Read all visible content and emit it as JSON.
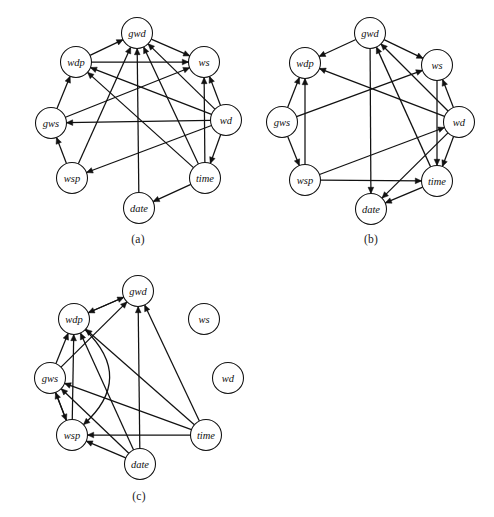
{
  "figure": {
    "width": 494,
    "height": 517,
    "background": "#ffffff",
    "ink_color": "#111111",
    "node_radius": 15.5,
    "arrow_size": 6.2
  },
  "panels": [
    {
      "id": "a",
      "caption": "(a)",
      "caption_x": 138,
      "caption_y": 233,
      "origin_x": 0,
      "origin_y": 0,
      "width": 247,
      "height": 225,
      "nodes": [
        {
          "name": "gwd",
          "label": "gwd",
          "x": 137,
          "y": 33
        },
        {
          "name": "wdp",
          "label": "wdp",
          "x": 76,
          "y": 62
        },
        {
          "name": "ws",
          "label": "ws",
          "x": 204,
          "y": 62
        },
        {
          "name": "gws",
          "label": "gws",
          "x": 51,
          "y": 123
        },
        {
          "name": "wd",
          "label": "wd",
          "x": 226,
          "y": 120
        },
        {
          "name": "wsp",
          "label": "wsp",
          "x": 72,
          "y": 178
        },
        {
          "name": "time",
          "label": "time",
          "x": 205,
          "y": 178
        },
        {
          "name": "date",
          "label": "date",
          "x": 139,
          "y": 208
        }
      ],
      "edges": [
        {
          "from": "wdp",
          "to": "gwd"
        },
        {
          "from": "gwd",
          "to": "ws"
        },
        {
          "from": "wdp",
          "to": "ws"
        },
        {
          "from": "gws",
          "to": "wdp"
        },
        {
          "from": "wsp",
          "to": "gws"
        },
        {
          "from": "wd",
          "to": "ws"
        },
        {
          "from": "wd",
          "to": "gwd"
        },
        {
          "from": "wd",
          "to": "wdp"
        },
        {
          "from": "wd",
          "to": "gws"
        },
        {
          "from": "wd",
          "to": "wsp"
        },
        {
          "from": "wd",
          "to": "time"
        },
        {
          "from": "time",
          "to": "gwd"
        },
        {
          "from": "time",
          "to": "ws"
        },
        {
          "from": "time",
          "to": "wdp"
        },
        {
          "from": "time",
          "to": "date"
        },
        {
          "from": "date",
          "to": "gwd"
        },
        {
          "from": "wsp",
          "to": "gwd"
        },
        {
          "from": "gws",
          "to": "ws"
        }
      ]
    },
    {
      "id": "b",
      "caption": "(b)",
      "caption_x": 371,
      "caption_y": 233,
      "origin_x": 247,
      "origin_y": 0,
      "width": 247,
      "height": 225,
      "nodes": [
        {
          "name": "gwd",
          "label": "gwd",
          "x": 370,
          "y": 33
        },
        {
          "name": "wdp",
          "label": "wdp",
          "x": 305,
          "y": 63
        },
        {
          "name": "ws",
          "label": "ws",
          "x": 437,
          "y": 65
        },
        {
          "name": "gws",
          "label": "gws",
          "x": 282,
          "y": 122
        },
        {
          "name": "wd",
          "label": "wd",
          "x": 459,
          "y": 122
        },
        {
          "name": "wsp",
          "label": "wsp",
          "x": 305,
          "y": 180
        },
        {
          "name": "time",
          "label": "time",
          "x": 437,
          "y": 181
        },
        {
          "name": "date",
          "label": "date",
          "x": 371,
          "y": 209
        }
      ],
      "edges": [
        {
          "from": "gwd",
          "to": "wdp"
        },
        {
          "from": "gwd",
          "to": "ws"
        },
        {
          "from": "gwd",
          "to": "date"
        },
        {
          "from": "gws",
          "to": "wdp"
        },
        {
          "from": "gws",
          "to": "ws"
        },
        {
          "from": "gws",
          "to": "wsp"
        },
        {
          "from": "wd",
          "to": "gwd"
        },
        {
          "from": "wd",
          "to": "ws"
        },
        {
          "from": "wd",
          "to": "wdp"
        },
        {
          "from": "wd",
          "to": "time"
        },
        {
          "from": "wd",
          "to": "date"
        },
        {
          "from": "ws",
          "to": "time"
        },
        {
          "from": "wsp",
          "to": "wdp"
        },
        {
          "from": "wsp",
          "to": "time"
        },
        {
          "from": "wsp",
          "to": "wd"
        },
        {
          "from": "time",
          "to": "gwd"
        },
        {
          "from": "time",
          "to": "date"
        }
      ]
    },
    {
      "id": "c",
      "caption": "(c)",
      "caption_x": 139,
      "caption_y": 490,
      "origin_x": 0,
      "origin_y": 255,
      "width": 260,
      "height": 235,
      "nodes": [
        {
          "name": "gwd",
          "label": "gwd",
          "x": 138,
          "y": 291
        },
        {
          "name": "wdp",
          "label": "wdp",
          "x": 74,
          "y": 319
        },
        {
          "name": "ws",
          "label": "ws",
          "x": 204,
          "y": 319
        },
        {
          "name": "gws",
          "label": "gws",
          "x": 50,
          "y": 378
        },
        {
          "name": "wd",
          "label": "wd",
          "x": 228,
          "y": 378
        },
        {
          "name": "wsp",
          "label": "wsp",
          "x": 72,
          "y": 435
        },
        {
          "name": "time",
          "label": "time",
          "x": 206,
          "y": 435
        },
        {
          "name": "date",
          "label": "date",
          "x": 140,
          "y": 464
        }
      ],
      "edges": [
        {
          "from": "gwd",
          "to": "wdp"
        },
        {
          "from": "wdp",
          "to": "gwd"
        },
        {
          "from": "gws",
          "to": "wdp"
        },
        {
          "from": "gws",
          "to": "gwd"
        },
        {
          "from": "gws",
          "to": "wsp"
        },
        {
          "from": "wsp",
          "to": "wdp"
        },
        {
          "from": "wsp",
          "to": "gws"
        },
        {
          "from": "date",
          "to": "gwd"
        },
        {
          "from": "date",
          "to": "wdp"
        },
        {
          "from": "date",
          "to": "gws"
        },
        {
          "from": "date",
          "to": "wsp"
        },
        {
          "from": "time",
          "to": "gwd"
        },
        {
          "from": "time",
          "to": "wdp"
        },
        {
          "from": "time",
          "to": "gws"
        },
        {
          "from": "time",
          "to": "wsp"
        },
        {
          "from": "wdp",
          "to": "wsp",
          "curve": -62
        }
      ],
      "isolated_nodes": [
        "ws",
        "wd"
      ]
    }
  ]
}
